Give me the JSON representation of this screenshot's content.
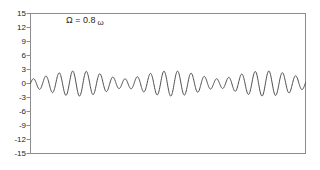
{
  "figure": {
    "background": "#ffffff",
    "axis_color": "#8c8c8c",
    "text_color": "#262626",
    "annotation": {
      "prefix": "Ω = 0.8",
      "symbol": "ω"
    }
  },
  "chart_data": {
    "type": "line",
    "title": "",
    "xlabel": "",
    "ylabel": "",
    "annotation": "Ω = 0.8 ω",
    "grid": false,
    "legend": null,
    "x_range": [
      0,
      40
    ],
    "ylim": [
      -15,
      15
    ],
    "y_ticks": [
      15,
      12,
      9,
      6,
      3,
      0,
      -3,
      -6,
      -9,
      -12,
      -15
    ],
    "x_tick_labels": [],
    "line_color": "#4d4d4d",
    "series": [
      {
        "name": "beat-waveform",
        "formula": "y(t) = 1.85·sin(3.31·t) − 0.85·sin(2.85·t)",
        "components": [
          {
            "amplitude": 1.85,
            "omega": 3.31,
            "phase": 0
          },
          {
            "amplitude": -0.85,
            "omega": 2.85,
            "phase": 0
          }
        ],
        "samples": 800
      }
    ]
  }
}
